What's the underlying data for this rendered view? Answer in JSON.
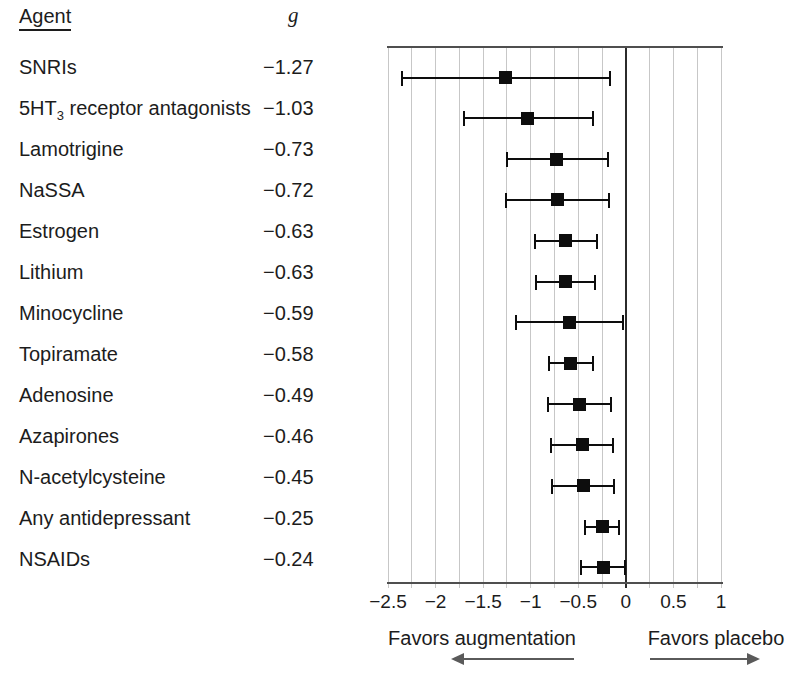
{
  "figure": {
    "columns": {
      "agent": "Agent",
      "effect_size": "g"
    },
    "footer": {
      "left_label": "Favors augmentation",
      "right_label": "Favors placebo"
    }
  },
  "colors": {
    "text": "#1c1c1c",
    "axis": "#4f4f4f",
    "gridline": "#c7c7c7",
    "zero_line": "#2b2b2b",
    "marker": "#0d0d0d",
    "arrow": "#5a5a5a",
    "background": "#ffffff"
  },
  "chart_data": {
    "type": "forest",
    "orientation": "horizontal",
    "title": "",
    "xlabel": "",
    "xlim": [
      -2.5,
      1
    ],
    "xticks": [
      -2.5,
      -2,
      -1.5,
      -1,
      -0.5,
      0,
      0.5,
      1
    ],
    "xtick_labels": [
      "−2.5",
      "−2",
      "−1.5",
      "−1",
      "−0.5",
      "0",
      "0.5",
      "1"
    ],
    "gridline_step": 0.25,
    "grid": true,
    "zero_reference_line": 0,
    "annotations": {
      "left_of_zero": "Favors augmentation",
      "right_of_zero": "Favors placebo"
    },
    "rows": [
      {
        "agent": "SNRIs",
        "g": -1.27,
        "g_label": "−1.27",
        "ci_low": -2.35,
        "ci_high": -0.17
      },
      {
        "agent": "5HT3 receptor antagonists",
        "agent_parts": [
          {
            "text": "5HT"
          },
          {
            "text": "3",
            "sub": true
          },
          {
            "text": " receptor antagonists"
          }
        ],
        "g": -1.03,
        "g_label": "−1.03",
        "ci_low": -1.7,
        "ci_high": -0.35
      },
      {
        "agent": "Lamotrigine",
        "g": -0.73,
        "g_label": "−0.73",
        "ci_low": -1.25,
        "ci_high": -0.19
      },
      {
        "agent": "NaSSA",
        "g": -0.72,
        "g_label": "−0.72",
        "ci_low": -1.26,
        "ci_high": -0.18
      },
      {
        "agent": "Estrogen",
        "g": -0.63,
        "g_label": "−0.63",
        "ci_low": -0.96,
        "ci_high": -0.3
      },
      {
        "agent": "Lithium",
        "g": -0.63,
        "g_label": "−0.63",
        "ci_low": -0.94,
        "ci_high": -0.32
      },
      {
        "agent": "Minocycline",
        "g": -0.59,
        "g_label": "−0.59",
        "ci_low": -1.15,
        "ci_high": -0.03
      },
      {
        "agent": "Topiramate",
        "g": -0.58,
        "g_label": "−0.58",
        "ci_low": -0.81,
        "ci_high": -0.35
      },
      {
        "agent": "Adenosine",
        "g": -0.49,
        "g_label": "−0.49",
        "ci_low": -0.82,
        "ci_high": -0.16
      },
      {
        "agent": "Azapirones",
        "g": -0.46,
        "g_label": "−0.46",
        "ci_low": -0.79,
        "ci_high": -0.13
      },
      {
        "agent": "N-acetylcysteine",
        "g": -0.45,
        "g_label": "−0.45",
        "ci_low": -0.78,
        "ci_high": -0.12
      },
      {
        "agent": "Any antidepressant",
        "g": -0.25,
        "g_label": "−0.25",
        "ci_low": -0.43,
        "ci_high": -0.07
      },
      {
        "agent": "NSAIDs",
        "g": -0.24,
        "g_label": "−0.24",
        "ci_low": -0.47,
        "ci_high": -0.01
      }
    ]
  }
}
